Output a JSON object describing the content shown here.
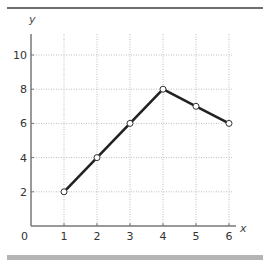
{
  "chart_data": {
    "type": "line",
    "title": "",
    "xlabel": "x",
    "ylabel": "y",
    "x": [
      1,
      2,
      3,
      4,
      5,
      6
    ],
    "values": [
      2,
      4,
      6,
      8,
      7,
      6
    ],
    "series": [
      {
        "name": "y",
        "x": [
          1,
          2,
          3,
          4,
          5,
          6
        ],
        "values": [
          2,
          4,
          6,
          8,
          7,
          6
        ],
        "marker": "open-circle",
        "color": "#222222"
      }
    ],
    "x_ticks": [
      "1",
      "2",
      "3",
      "4",
      "5",
      "6"
    ],
    "y_ticks": [
      "2",
      "4",
      "6",
      "8",
      "10"
    ],
    "origin_label": "0",
    "xlim": [
      0,
      6.5
    ],
    "ylim": [
      0,
      11
    ],
    "grid": true,
    "grid_style": "dotted",
    "legend": null
  },
  "colors": {
    "line": "#222222",
    "axis": "#777777",
    "grid": "#bdbdbd",
    "top_rule": "#6e6e6e",
    "bottom_bar": "#b4b4b4"
  }
}
